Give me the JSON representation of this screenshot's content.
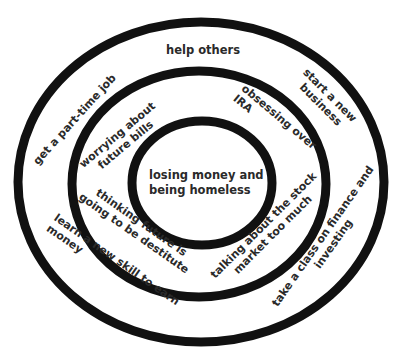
{
  "colors": {
    "ring_stroke": "#111111",
    "text": "#2a2a2a",
    "background": "#ffffff"
  },
  "diagram": {
    "type": "concentric-circles",
    "rings": [
      {
        "name": "outer-ring",
        "level": "outer"
      },
      {
        "name": "middle-ring",
        "level": "middle"
      },
      {
        "name": "inner-ring",
        "level": "inner"
      }
    ],
    "center": {
      "lines": [
        "losing money and",
        "being homeless"
      ]
    },
    "middle_band": [
      {
        "id": "worrying",
        "lines": [
          "worrying about",
          "future bills"
        ]
      },
      {
        "id": "obsessing",
        "lines": [
          "obsessing over",
          "IRA"
        ]
      },
      {
        "id": "thinking",
        "lines": [
          "thinking future is",
          "going to be destitute"
        ]
      },
      {
        "id": "talking",
        "lines": [
          "talking about the stock",
          "market too much"
        ]
      }
    ],
    "outer_band": [
      {
        "id": "help",
        "lines": [
          "help others"
        ]
      },
      {
        "id": "parttime",
        "lines": [
          "get a part-time job"
        ]
      },
      {
        "id": "business",
        "lines": [
          "start a new",
          "business"
        ]
      },
      {
        "id": "learn",
        "lines": [
          "learn a new skill to earn",
          "money"
        ]
      },
      {
        "id": "class",
        "lines": [
          "take a class on finance and",
          "investing"
        ]
      }
    ]
  }
}
